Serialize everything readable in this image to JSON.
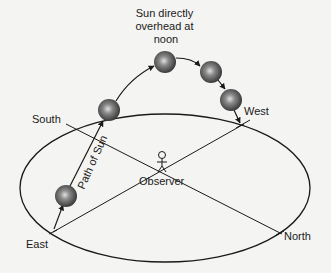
{
  "diagram": {
    "title_annotation": [
      "Sun directly",
      "overhead at",
      "noon"
    ],
    "labels": {
      "south": "South",
      "north": "North",
      "east": "East",
      "west": "West",
      "observer": "Observer",
      "path": "Path of Sun"
    },
    "sun_count": 5,
    "colors": {
      "line": "#1a1a1a",
      "sun_dark": "#3a3a3a",
      "sun_light": "#d8d8d8",
      "background": "#f4f4f2"
    }
  }
}
